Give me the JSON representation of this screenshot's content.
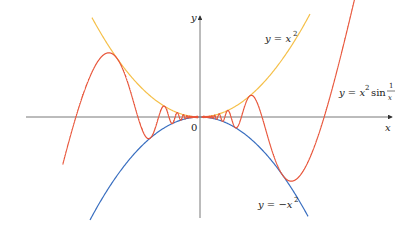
{
  "figure": {
    "axes": {
      "x_label": "x",
      "y_label": "y",
      "origin_label": "0",
      "axis_color": "#555555"
    },
    "curves": [
      {
        "name": "upper-envelope",
        "label_prefix": "y = x",
        "label_exp": "2",
        "color": "#f5c04a"
      },
      {
        "name": "lower-envelope",
        "label_prefix": "y = −x",
        "label_exp": "2",
        "color": "#3a6fc0"
      },
      {
        "name": "oscillating-curve",
        "label_prefix": "y = x",
        "label_exp": "2",
        "label_func": "sin",
        "label_num": "1",
        "label_den": "x",
        "color": "#e8553a"
      }
    ]
  },
  "chart_data": {
    "type": "line",
    "title": "",
    "xlabel": "x",
    "ylabel": "y",
    "series": [
      {
        "name": "y = x^2",
        "formula": "x^2"
      },
      {
        "name": "y = -x^2",
        "formula": "-x^2"
      },
      {
        "name": "y = x^2 sin(1/x)",
        "formula": "x^2*sin(1/x)"
      }
    ],
    "xlim": [
      -0.45,
      0.49
    ],
    "ylim": [
      -0.078,
      0.09
    ],
    "x_intercepts_shown": [
      -0.3183,
      0.3183
    ],
    "grid": false,
    "legend": "inline labels"
  }
}
